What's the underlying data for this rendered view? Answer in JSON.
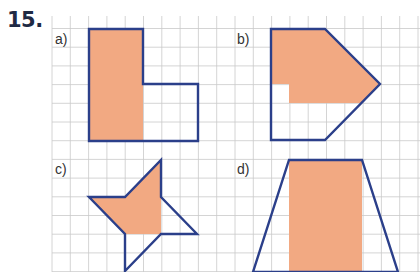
{
  "exercise": {
    "number": "15."
  },
  "colors": {
    "fill": "#F2A982",
    "outline": "#2B3F8A",
    "grid": "#C9C9C9"
  },
  "grid": {
    "x0": 52,
    "y0": 28.5,
    "dx": 18.3,
    "dy": 18.7,
    "top": 16,
    "left": 52,
    "right": 420,
    "bottom": 272
  },
  "figures": [
    {
      "label": "a)",
      "label_pos": [
        55,
        44
      ],
      "outline": [
        [
          89,
          29
        ],
        [
          143,
          29
        ],
        [
          143,
          84
        ],
        [
          198,
          84
        ],
        [
          198,
          141
        ],
        [
          89,
          141
        ]
      ],
      "fill": [
        [
          89,
          29
        ],
        [
          143,
          29
        ],
        [
          143,
          141
        ],
        [
          89,
          141
        ]
      ]
    },
    {
      "label": "b)",
      "label_pos": [
        237,
        44
      ],
      "outline": [
        [
          271,
          29
        ],
        [
          325,
          29
        ],
        [
          380,
          84
        ],
        [
          325,
          140
        ],
        [
          271,
          140
        ]
      ],
      "fill": [
        [
          271,
          29
        ],
        [
          325,
          29
        ],
        [
          380,
          84
        ],
        [
          362,
          103
        ],
        [
          289,
          103
        ],
        [
          289,
          84
        ],
        [
          271,
          84
        ]
      ]
    },
    {
      "label": "c)",
      "label_pos": [
        55,
        174
      ],
      "outline": [
        [
          161,
          160
        ],
        [
          161,
          197
        ],
        [
          197,
          234
        ],
        [
          161,
          234
        ],
        [
          125,
          271
        ],
        [
          125,
          234
        ],
        [
          89,
          197
        ],
        [
          125,
          197
        ]
      ],
      "fill": [
        [
          89,
          197
        ],
        [
          125,
          197
        ],
        [
          161,
          160
        ],
        [
          161,
          234
        ],
        [
          125,
          234
        ]
      ]
    },
    {
      "label": "d)",
      "label_pos": [
        237,
        174
      ],
      "outline": [
        [
          289,
          160
        ],
        [
          362,
          160
        ],
        [
          398,
          272
        ],
        [
          253,
          272
        ]
      ],
      "fill": [
        [
          289,
          160
        ],
        [
          362,
          160
        ],
        [
          362,
          272
        ],
        [
          289,
          272
        ]
      ]
    }
  ]
}
